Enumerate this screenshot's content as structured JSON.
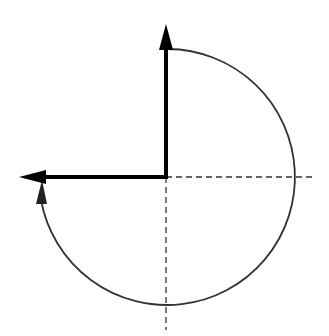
{
  "diagram": {
    "origin": {
      "x": 166,
      "y": 177
    },
    "vectors": [
      {
        "name": "initial-vector",
        "direction": "up",
        "length": 150
      },
      {
        "name": "rotated-vector",
        "direction": "left",
        "length": 146
      }
    ],
    "axes": {
      "horizontal_dashed_to_x": 313,
      "vertical_dashed_to_y": 330
    },
    "rotation_arc": {
      "radius": 128,
      "direction": "clockwise",
      "angle_degrees": 270
    },
    "colors": {
      "vector": "#000000",
      "arc": "#333333",
      "dashed": "#333333"
    }
  }
}
